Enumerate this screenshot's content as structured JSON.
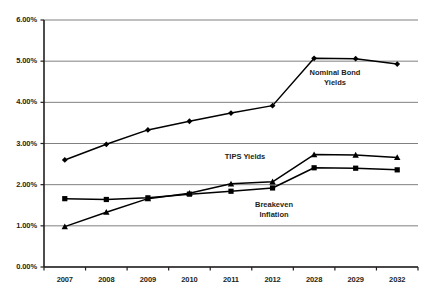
{
  "chart_data": {
    "type": "line",
    "title": "",
    "xlabel": "",
    "ylabel": "",
    "categories": [
      "2007",
      "2008",
      "2009",
      "2010",
      "2011",
      "2012",
      "2028",
      "2029",
      "2032"
    ],
    "ylim": [
      0,
      6
    ],
    "ytick_labels": [
      "0.00%",
      "1.00%",
      "2.00%",
      "3.00%",
      "4.00%",
      "5.00%",
      "6.00%"
    ],
    "ytick_values": [
      0,
      1,
      2,
      3,
      4,
      5,
      6
    ],
    "grid": "horizontal",
    "legend_position": "inline-annotations",
    "series": [
      {
        "name": "Nominal Bond Yields",
        "marker": "diamond",
        "color": "#000000",
        "values": [
          2.6,
          2.98,
          3.33,
          3.54,
          3.74,
          3.92,
          5.07,
          5.06,
          4.93
        ]
      },
      {
        "name": "TIPS Yields",
        "marker": "triangle",
        "color": "#000000",
        "values": [
          0.98,
          1.33,
          1.66,
          1.79,
          2.02,
          2.07,
          2.73,
          2.72,
          2.66
        ]
      },
      {
        "name": "Breakeven Inflation",
        "marker": "square",
        "color": "#000000",
        "values": [
          1.66,
          1.64,
          1.68,
          1.77,
          1.84,
          1.92,
          2.41,
          2.4,
          2.36
        ]
      }
    ],
    "annotations": [
      {
        "name": "nominal-bond-yields-label",
        "lines": [
          "Nominal Bond",
          "Yields"
        ],
        "x": 335,
        "y": 68
      },
      {
        "name": "tips-yields-label",
        "lines": [
          "TIPS Yields"
        ],
        "x": 245,
        "y": 152
      },
      {
        "name": "breakeven-inflation-label",
        "lines": [
          "Breakeven",
          "Inflation"
        ],
        "x": 274,
        "y": 200
      }
    ],
    "colors": {
      "gridline": "#808080",
      "axis": "#231f20",
      "line": "#000000",
      "background": "#ffffff"
    }
  },
  "geometry": {
    "plot_left": 44,
    "plot_right": 418,
    "plot_top": 20,
    "plot_bottom": 267
  }
}
